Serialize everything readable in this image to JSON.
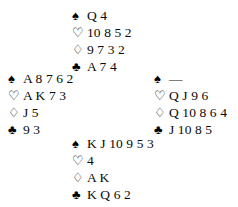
{
  "diagram": {
    "type": "bridge-hand-deal",
    "background_color": "#ffffff",
    "ink_color": "#0a0a0a",
    "suit_symbols": {
      "spade": "♠",
      "heart": "♡",
      "diamond": "♢",
      "club": "♣"
    },
    "void_marker": "—"
  },
  "hands": {
    "north": {
      "position": "north",
      "spades": "Q 4",
      "hearts": "10 8 5 2",
      "diamonds": "9 7 3 2",
      "clubs": "A 7 4"
    },
    "west": {
      "position": "west",
      "spades": "A 8 7 6 2",
      "hearts": "A K 7 3",
      "diamonds": "J 5",
      "clubs": "9 3"
    },
    "east": {
      "position": "east",
      "spades": "—",
      "hearts": "Q J 9 6",
      "diamonds": "Q 10 8 6 4",
      "clubs": "J 10 8 5"
    },
    "south": {
      "position": "south",
      "spades": "K J 10 9 5 3",
      "hearts": "4",
      "diamonds": "A K",
      "clubs": "K Q 6 2"
    }
  }
}
